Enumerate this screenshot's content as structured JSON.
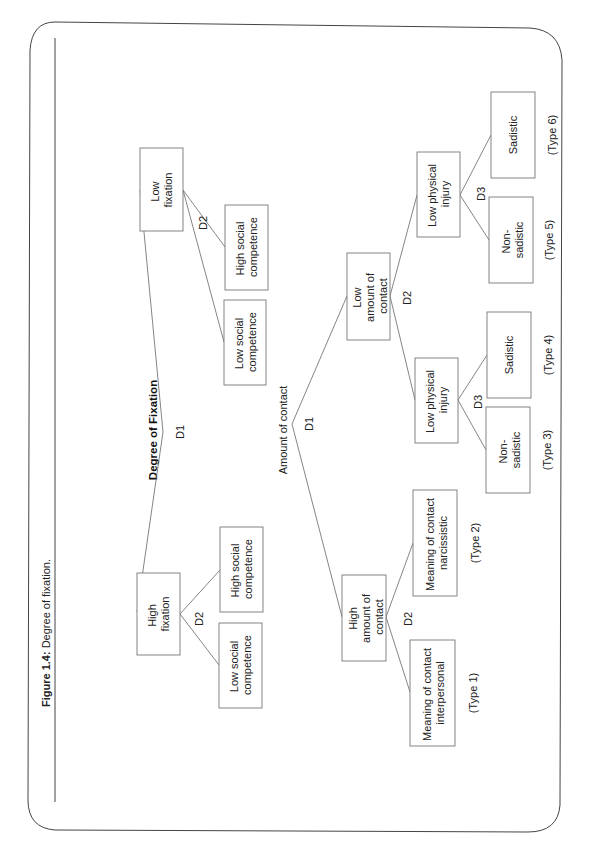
{
  "figure": {
    "caption_label": "Figure 1.4:",
    "caption_text": " Degree of fixation.",
    "orientation": "rotated 90° counterclockwise"
  },
  "tree1": {
    "title": "Degree of Fixation",
    "root_decision": "D1",
    "nodes": {
      "low_fixation": [
        "Low",
        "fixation"
      ],
      "high_fixation": [
        "High",
        "fixation"
      ],
      "low_fix_d2": "D2",
      "high_fix_d2": "D2",
      "low_fix_low_social": [
        "Low social",
        "competence"
      ],
      "low_fix_high_social": [
        "High social",
        "competence"
      ],
      "high_fix_low_social": [
        "Low social",
        "competence"
      ],
      "high_fix_high_social": [
        "High social",
        "competence"
      ]
    }
  },
  "tree2": {
    "title": "Amount of contact",
    "root_decision": "D1",
    "nodes": {
      "low_amount": [
        "Low",
        "amount of",
        "contact"
      ],
      "high_amount": [
        "High",
        "amount of",
        "contact"
      ],
      "low_amount_d2": "D2",
      "high_amount_d2": "D2",
      "lpi_a": [
        "Low physical",
        "injury"
      ],
      "lpi_b": [
        "Low physical",
        "injury"
      ],
      "lpi_a_d3": "D3",
      "lpi_b_d3": "D3",
      "sadistic_6": [
        "Sadistic"
      ],
      "nonsadistic_5": [
        "Non-",
        "sadistic"
      ],
      "sadistic_4": [
        "Sadistic"
      ],
      "nonsadistic_3": [
        "Non-",
        "sadistic"
      ],
      "meaning_narcissistic": [
        "Meaning of contact",
        "narcissistic"
      ],
      "meaning_interpersonal": [
        "Meaning of contact",
        "interpersonal"
      ]
    },
    "types": {
      "t1": "(Type 1)",
      "t2": "(Type 2)",
      "t3": "(Type 3)",
      "t4": "(Type 4)",
      "t5": "(Type 5)",
      "t6": "(Type 6)"
    }
  }
}
